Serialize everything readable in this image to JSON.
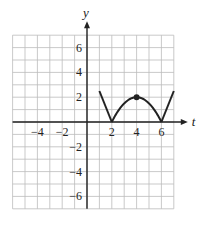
{
  "chart_data": {
    "type": "line",
    "title": "",
    "xlabel": "t",
    "ylabel": "y",
    "xlim": [
      -6,
      7
    ],
    "ylim": [
      -7,
      7
    ],
    "grid": true,
    "x_ticks": [
      -4,
      -2,
      2,
      4,
      6
    ],
    "y_ticks": [
      6,
      4,
      2,
      -2,
      -4,
      -6
    ],
    "x_tick_labels": [
      "−4",
      "−2",
      "2",
      "4",
      "6"
    ],
    "y_tick_labels": [
      "6",
      "4",
      "2",
      "−2",
      "−4",
      "−6"
    ],
    "series": [
      {
        "name": "y(t)",
        "segments": [
          {
            "kind": "line",
            "points": [
              [
                1,
                2.5
              ],
              [
                2,
                0
              ]
            ]
          },
          {
            "kind": "parabola",
            "vertex": [
              4,
              2
            ],
            "roots": [
              2,
              6
            ]
          },
          {
            "kind": "line",
            "points": [
              [
                6,
                0
              ],
              [
                7,
                2.5
              ]
            ]
          }
        ],
        "marked_points": [
          [
            4,
            2
          ]
        ]
      }
    ],
    "colors": {
      "curve": "#222222",
      "grid": "#bbbbbb",
      "axis": "#222222"
    }
  }
}
